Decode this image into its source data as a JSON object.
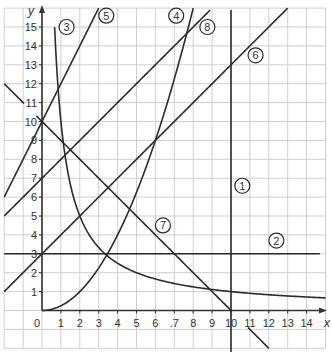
{
  "chart_data": {
    "type": "line",
    "title": "",
    "xlabel": "x",
    "ylabel": "y",
    "origin_label": "0",
    "xlim": [
      -2,
      15
    ],
    "ylim": [
      -2,
      16
    ],
    "grid": true,
    "x_ticks": [
      "1",
      "2",
      "3",
      "4",
      "5",
      "6",
      ".7",
      "8",
      "9",
      "10",
      "11",
      "12",
      "13",
      "14"
    ],
    "y_ticks": [
      "1",
      "2",
      "3",
      "4",
      "5",
      "6",
      "7",
      "8",
      "9",
      "10",
      "11",
      "12",
      "13",
      "14",
      "15"
    ],
    "series": [
      {
        "name": "1",
        "kind": "vertical",
        "equation": "x = 10",
        "x": 10,
        "y_range": [
          -2,
          16
        ],
        "label_pos": [
          10.6,
          6.6
        ]
      },
      {
        "name": "2",
        "kind": "function",
        "equation": "y = 3",
        "fn": "3",
        "x_range": [
          -2,
          14.7
        ],
        "label_pos": [
          12.4,
          3.7
        ]
      },
      {
        "name": "3",
        "kind": "function",
        "equation": "y = 10/x",
        "fn": "10/x",
        "x_range": [
          0.667,
          15
        ],
        "label_pos": [
          1.3,
          15.0
        ]
      },
      {
        "name": "4",
        "kind": "function",
        "equation": "y = x^2/4",
        "fn": "x*x/4",
        "x_range": [
          0,
          8.0
        ],
        "label_pos": [
          7.1,
          15.6
        ]
      },
      {
        "name": "5",
        "kind": "function",
        "equation": "y = 2x + 10",
        "fn": "2*x+10",
        "x_range": [
          -2,
          3.0
        ],
        "label_pos": [
          3.4,
          15.6
        ]
      },
      {
        "name": "6",
        "kind": "function",
        "equation": "y = x + 3",
        "fn": "x+3",
        "x_range": [
          -2,
          13
        ],
        "label_pos": [
          11.3,
          13.5
        ]
      },
      {
        "name": "7",
        "kind": "function",
        "equation": "y = 10 - x",
        "fn": "10-x",
        "segments": [
          [
            -2,
            -0.95
          ],
          [
            -0.3,
            10.0
          ],
          [
            10.9,
            12
          ]
        ],
        "label_pos": [
          6.4,
          4.5
        ]
      },
      {
        "name": "8",
        "kind": "function",
        "equation": "y = x + 7",
        "fn": "x+7",
        "x_range": [
          -2,
          8.9
        ],
        "label_pos": [
          8.75,
          15.0
        ]
      }
    ],
    "intersections_visible": [
      {
        "of": [
          "2",
          "3"
        ],
        "point": [
          3.33,
          3
        ]
      },
      {
        "of": [
          "2",
          "4"
        ],
        "point": [
          3.46,
          3
        ]
      },
      {
        "of": [
          "3",
          "6"
        ],
        "point": [
          2,
          5
        ]
      },
      {
        "of": [
          "4",
          "6"
        ],
        "point": [
          6,
          9
        ]
      },
      {
        "of": [
          "4",
          "8"
        ],
        "point": [
          7.66,
          14.66
        ]
      },
      {
        "of": [
          "5",
          "7"
        ],
        "point": [
          0,
          10
        ]
      },
      {
        "of": [
          "3",
          "7"
        ],
        "point": [
          8.87,
          1.13
        ]
      },
      {
        "of": [
          "1",
          "7"
        ],
        "point": [
          10,
          0
        ]
      },
      {
        "of": [
          "1",
          "6"
        ],
        "point": [
          10,
          13
        ]
      }
    ]
  },
  "style": {
    "line_color": "#2b2b2b",
    "grid_color": "#cfcfcf",
    "axis_color": "#333333"
  }
}
